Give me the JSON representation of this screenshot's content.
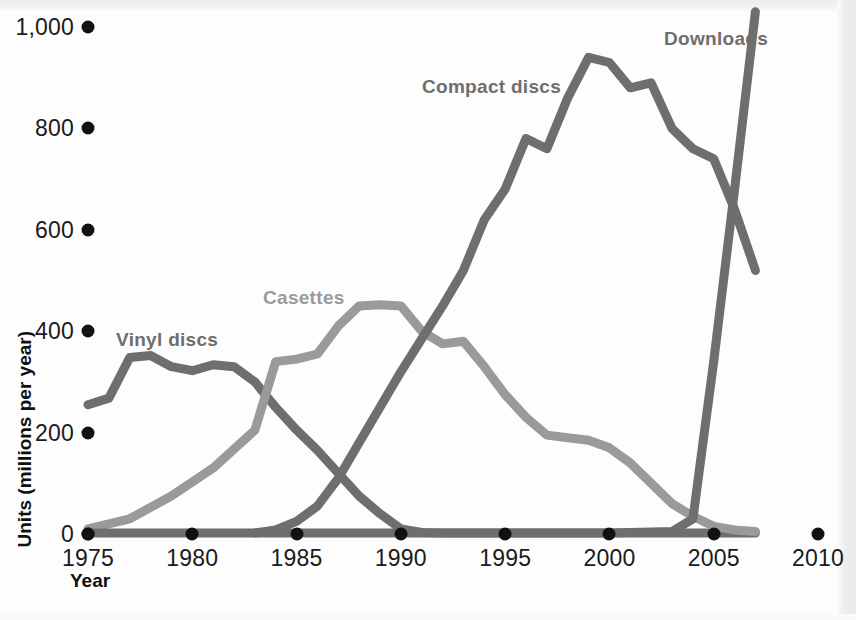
{
  "chart_data": {
    "type": "line",
    "title": "",
    "xlabel": "Year",
    "ylabel": "Units (millions per year)",
    "xlim": [
      1975,
      2010
    ],
    "ylim": [
      0,
      1000
    ],
    "grid": false,
    "legend_position": "inline-annotations",
    "x_ticks": [
      "1975",
      "1980",
      "1985",
      "1990",
      "1995",
      "2000",
      "2005",
      "2010"
    ],
    "y_ticks": [
      "0",
      "200",
      "400",
      "600",
      "800",
      "1,000"
    ],
    "series": [
      {
        "name": "Vinyl discs",
        "color": "#6e6e6e",
        "x": [
          1975,
          1976,
          1977,
          1978,
          1979,
          1980,
          1981,
          1982,
          1983,
          1984,
          1985,
          1986,
          1987,
          1988,
          1989,
          1990,
          1991,
          1992,
          1995,
          2000,
          2005,
          2007
        ],
        "values": [
          255,
          268,
          348,
          352,
          330,
          322,
          334,
          330,
          300,
          250,
          205,
          165,
          120,
          75,
          40,
          10,
          3,
          2,
          2,
          2,
          2,
          2
        ]
      },
      {
        "name": "Casettes",
        "color": "#9a9a9a",
        "x": [
          1975,
          1977,
          1979,
          1981,
          1983,
          1984,
          1985,
          1986,
          1987,
          1988,
          1989,
          1990,
          1991,
          1992,
          1993,
          1994,
          1995,
          1996,
          1997,
          1998,
          1999,
          2000,
          2001,
          2002,
          2003,
          2004,
          2005,
          2006,
          2007
        ],
        "values": [
          10,
          30,
          75,
          130,
          205,
          340,
          345,
          355,
          410,
          450,
          452,
          450,
          400,
          375,
          380,
          330,
          275,
          230,
          195,
          190,
          185,
          170,
          140,
          100,
          60,
          35,
          15,
          8,
          5
        ]
      },
      {
        "name": "Compact discs",
        "color": "#6e6e6e",
        "x": [
          1983,
          1984,
          1985,
          1986,
          1987,
          1988,
          1989,
          1990,
          1991,
          1992,
          1993,
          1994,
          1995,
          1996,
          1997,
          1998,
          1999,
          2000,
          2001,
          2002,
          2003,
          2004,
          2005,
          2006,
          2007
        ],
        "values": [
          2,
          8,
          25,
          55,
          110,
          180,
          250,
          320,
          385,
          450,
          520,
          620,
          680,
          780,
          760,
          860,
          940,
          930,
          880,
          890,
          800,
          760,
          740,
          640,
          520
        ]
      },
      {
        "name": "Downloads",
        "color": "#6e6e6e",
        "x": [
          1975,
          2000,
          2003,
          2004,
          2005,
          2006,
          2007
        ],
        "values": [
          2,
          2,
          5,
          30,
          340,
          680,
          1030
        ]
      }
    ],
    "annotations": [
      {
        "text": "Vinyl discs",
        "near_year": 1978,
        "near_value": 400
      },
      {
        "text": "Casettes",
        "near_year": 1984,
        "near_value": 480
      },
      {
        "text": "Compact discs",
        "near_year": 1994,
        "near_value": 900
      },
      {
        "text": "Downloads",
        "near_year": 2006,
        "near_value": 990
      }
    ]
  },
  "axes": {
    "y_label": "Units (millions per year)",
    "x_label": "Year",
    "y_ticks": [
      {
        "label": "1,000",
        "value": 1000
      },
      {
        "label": "800",
        "value": 800
      },
      {
        "label": "600",
        "value": 600
      },
      {
        "label": "400",
        "value": 400
      },
      {
        "label": "200",
        "value": 200
      },
      {
        "label": "0",
        "value": 0
      }
    ],
    "x_ticks": [
      {
        "label": "1975",
        "value": 1975
      },
      {
        "label": "1980",
        "value": 1980
      },
      {
        "label": "1985",
        "value": 1985
      },
      {
        "label": "1990",
        "value": 1990
      },
      {
        "label": "1995",
        "value": 1995
      },
      {
        "label": "2000",
        "value": 2000
      },
      {
        "label": "2005",
        "value": 2005
      },
      {
        "label": "2010",
        "value": 2010
      }
    ]
  },
  "labels": {
    "vinyl": "Vinyl discs",
    "cassette": "Casettes",
    "cd": "Compact discs",
    "downloads": "Downloads"
  },
  "colors": {
    "dark_gray": "#6e6e6e",
    "light_gray": "#9a9a9a",
    "tick_dot": "#111111",
    "text": "#1a1a1a",
    "background": "#fdfdfd"
  }
}
